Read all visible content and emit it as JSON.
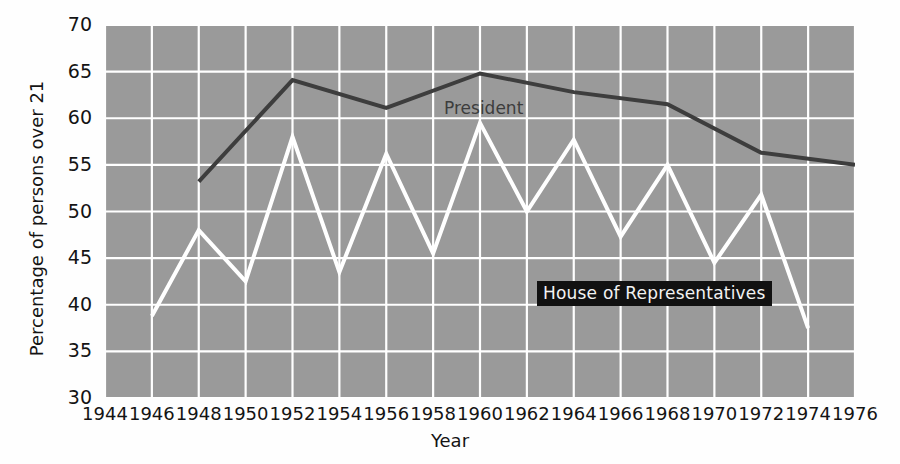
{
  "chart_data": {
    "type": "line",
    "title": "",
    "xlabel": "Year",
    "ylabel": "Percentage of persons over 21",
    "xlim": [
      1944,
      1976
    ],
    "ylim": [
      30,
      70
    ],
    "xticks": [
      1944,
      1946,
      1948,
      1950,
      1952,
      1954,
      1956,
      1958,
      1960,
      1962,
      1964,
      1966,
      1968,
      1970,
      1972,
      1974,
      1976
    ],
    "xtick_labels": [
      "1944",
      "1946",
      "1948",
      "1950",
      "1952",
      "1954",
      "1956",
      "1958",
      "1960",
      "1962",
      "1964",
      "1966",
      "1968",
      "1970",
      "1972",
      "1974",
      "1976"
    ],
    "yticks": [
      30,
      35,
      40,
      45,
      50,
      55,
      60,
      65,
      70
    ],
    "ytick_labels": [
      "30",
      "35",
      "40",
      "45",
      "50",
      "55",
      "60",
      "65",
      "70"
    ],
    "grid": true,
    "grid_color": "#ffffff",
    "plot_background": "#9a9a9a",
    "legend": "inline-annotations",
    "series": [
      {
        "name": "President",
        "color": "#3d3d3d",
        "line_width": 4,
        "label_position": "inline",
        "x": [
          1948,
          1952,
          1956,
          1960,
          1964,
          1968,
          1972,
          1976
        ],
        "values": [
          53.2,
          64.1,
          61.1,
          64.8,
          62.8,
          61.5,
          56.3,
          55.0
        ]
      },
      {
        "name": "House of Representatives",
        "color": "#ffffff",
        "line_width": 4,
        "label_position": "inline",
        "x": [
          1946,
          1948,
          1950,
          1952,
          1954,
          1956,
          1958,
          1960,
          1962,
          1964,
          1966,
          1968,
          1970,
          1972,
          1974
        ],
        "values": [
          38.8,
          48.0,
          42.5,
          58.0,
          43.5,
          56.2,
          45.5,
          59.5,
          50.0,
          57.7,
          47.3,
          55.0,
          44.5,
          51.8,
          37.5
        ]
      }
    ],
    "annotations": [
      {
        "text": "President",
        "style": "plain-dark-text"
      },
      {
        "text": "House of Representatives",
        "style": "white-text-on-black-box"
      }
    ]
  }
}
